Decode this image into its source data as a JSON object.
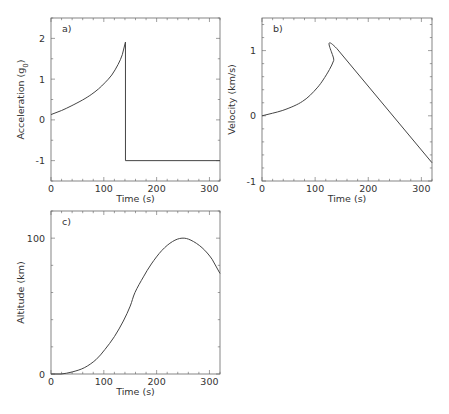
{
  "chart_data": [
    {
      "id": "a",
      "type": "line",
      "panel_label": "a)",
      "xlabel": "Time (s)",
      "ylabel": "Acceleration (g",
      "ylabel_sub": "0",
      "ylabel_end": ")",
      "xlim": [
        0,
        320
      ],
      "ylim": [
        -1.5,
        2.5
      ],
      "xticks": [
        0,
        100,
        200,
        300
      ],
      "xminor": 20,
      "yticks": [
        -1,
        0,
        1,
        2
      ],
      "yminor": 0.5,
      "grid": false,
      "series": [
        {
          "name": "acceleration",
          "x": [
            0,
            20,
            38,
            60,
            76,
            90,
            102,
            115,
            127,
            135,
            141,
            141,
            320
          ],
          "y": [
            0.13,
            0.23,
            0.34,
            0.49,
            0.62,
            0.76,
            0.91,
            1.1,
            1.36,
            1.6,
            1.91,
            -1.0,
            -1.0
          ]
        }
      ],
      "frame": {
        "left": 51,
        "top": 18,
        "right": 220,
        "bottom": 181
      }
    },
    {
      "id": "b",
      "type": "line",
      "panel_label": "b)",
      "xlabel": "Time (s)",
      "ylabel": "Velocity (km/s)",
      "xlim": [
        0,
        320
      ],
      "ylim": [
        -1,
        1.5
      ],
      "xticks": [
        0,
        100,
        200,
        300
      ],
      "xminor": 20,
      "yticks": [
        -1,
        0,
        1
      ],
      "yminor": 0.2,
      "grid": false,
      "series": [
        {
          "name": "velocity",
          "x": [
            0,
            20,
            38,
            60,
            76,
            90,
            105,
            115,
            127,
            135,
            141,
            320
          ],
          "y": [
            0,
            0.04,
            0.08,
            0.15,
            0.22,
            0.31,
            0.44,
            0.55,
            0.71,
            0.85,
            1.03,
            -0.72
          ]
        }
      ],
      "frame": {
        "left": 262,
        "top": 18,
        "right": 432,
        "bottom": 181
      }
    },
    {
      "id": "c",
      "type": "line",
      "panel_label": "c)",
      "xlabel": "Time (s)",
      "ylabel": "Altitude (km)",
      "xlim": [
        0,
        320
      ],
      "ylim": [
        0,
        120
      ],
      "xticks": [
        0,
        100,
        200,
        300
      ],
      "xminor": 20,
      "yticks": [
        0,
        100
      ],
      "yminor": 20,
      "grid": false,
      "series": [
        {
          "name": "altitude",
          "x": [
            0,
            19,
            40,
            63,
            85,
            102,
            120,
            137,
            150,
            159,
            175,
            190,
            210,
            230,
            248,
            265,
            286,
            305,
            320
          ],
          "y": [
            0,
            0,
            1.5,
            4.6,
            10.5,
            18,
            27.5,
            39,
            50,
            60,
            71.5,
            81,
            91,
            97.5,
            100,
            98.5,
            93,
            84.5,
            74
          ]
        }
      ],
      "frame": {
        "left": 51,
        "top": 211,
        "right": 220,
        "bottom": 374
      }
    }
  ]
}
